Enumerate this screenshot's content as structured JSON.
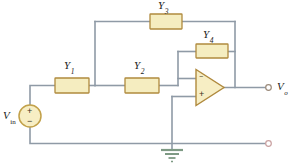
{
  "diagram": {
    "background": "#ffffff",
    "wire_color": "#8f9aa6",
    "component_fill": "#f5edc0",
    "component_stroke": "#b08a3e",
    "source_fill": "#f7eec4",
    "source_stroke": "#c2a14a",
    "ground_color": "#7e9a84",
    "terminal_stroke": "#9b8a7a",
    "label_color": "#1a1a1a"
  },
  "components": {
    "y1": {
      "label": "Y",
      "subscript": "1",
      "name": "admittance-y1"
    },
    "y2": {
      "label": "Y",
      "subscript": "2",
      "name": "admittance-y2"
    },
    "y3": {
      "label": "Y",
      "subscript": "3",
      "name": "admittance-y3"
    },
    "y4": {
      "label": "Y",
      "subscript": "4",
      "name": "admittance-y4"
    }
  },
  "source": {
    "label": "V",
    "subscript": "in",
    "plus": "+",
    "minus": "−"
  },
  "opamp": {
    "inverting_sign": "−",
    "noninverting_sign": "+"
  },
  "output": {
    "label": "V",
    "subscript": "o"
  },
  "ground": {
    "name": "ground-symbol"
  }
}
